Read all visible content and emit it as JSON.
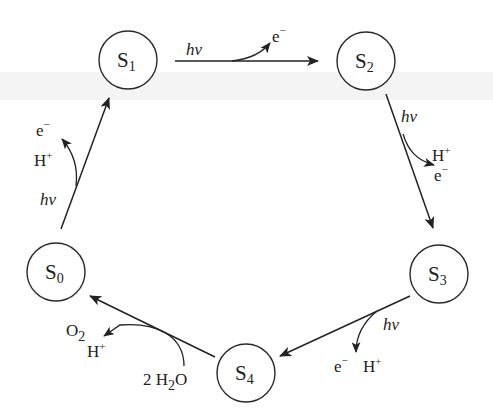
{
  "diagram": {
    "type": "cycle",
    "nodes": [
      {
        "id": "S0",
        "base": "S",
        "sub": "0",
        "cx": 56,
        "cy": 272
      },
      {
        "id": "S1",
        "base": "S",
        "sub": "1",
        "cx": 128,
        "cy": 60
      },
      {
        "id": "S2",
        "base": "S",
        "sub": "2",
        "cx": 366,
        "cy": 61
      },
      {
        "id": "S3",
        "base": "S",
        "sub": "3",
        "cx": 439,
        "cy": 274
      },
      {
        "id": "S4",
        "base": "S",
        "sub": "4",
        "cx": 246,
        "cy": 373
      }
    ],
    "edges": [
      {
        "from": "S0",
        "to": "S1",
        "light": "hν",
        "released": [
          "H+",
          "e−"
        ]
      },
      {
        "from": "S1",
        "to": "S2",
        "light": "hν",
        "released": [
          "e−"
        ]
      },
      {
        "from": "S2",
        "to": "S3",
        "light": "hν",
        "released": [
          "H+",
          "e−"
        ]
      },
      {
        "from": "S3",
        "to": "S4",
        "light": "hν",
        "released": [
          "e−",
          "H+"
        ]
      },
      {
        "from": "S4",
        "to": "S0",
        "consumed": [
          "2 H2O"
        ],
        "released": [
          "O2",
          "H+"
        ]
      }
    ],
    "labels": {
      "hv": "hν",
      "e": "e",
      "minus": "−",
      "H": "H",
      "plus": "+",
      "O": "O",
      "two": "2",
      "water_prefix": "2 H",
      "water_suffix": "O"
    }
  }
}
